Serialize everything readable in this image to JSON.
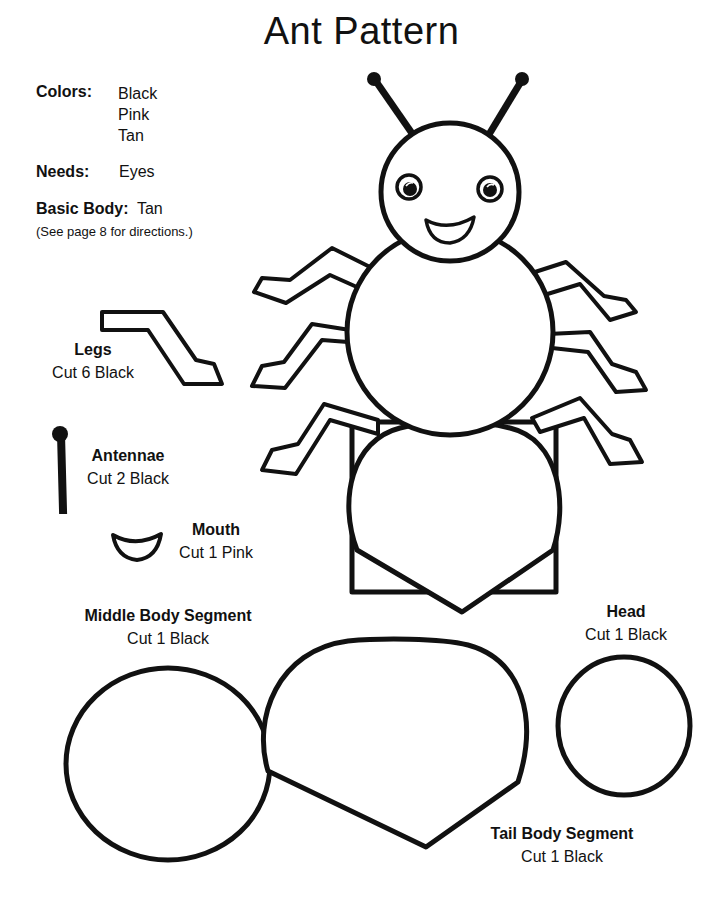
{
  "title": "Ant Pattern",
  "info": {
    "colors_label": "Colors:",
    "colors": [
      "Black",
      "Pink",
      "Tan"
    ],
    "needs_label": "Needs:",
    "needs_value": "Eyes",
    "basic_body_label": "Basic Body:",
    "basic_body_value": "Tan",
    "basic_body_note": "(See page 8 for directions.)"
  },
  "pieces": {
    "legs": {
      "name": "Legs",
      "instruction": "Cut 6 Black"
    },
    "antennae": {
      "name": "Antennae",
      "instruction": "Cut 2 Black"
    },
    "mouth": {
      "name": "Mouth",
      "instruction": "Cut 1 Pink"
    },
    "middle_body": {
      "name": "Middle Body Segment",
      "instruction": "Cut 1 Black"
    },
    "head": {
      "name": "Head",
      "instruction": "Cut 1 Black"
    },
    "tail_body": {
      "name": "Tail Body Segment",
      "instruction": "Cut 1 Black"
    }
  },
  "colors": {
    "ink": "#111111",
    "paper": "#ffffff"
  }
}
